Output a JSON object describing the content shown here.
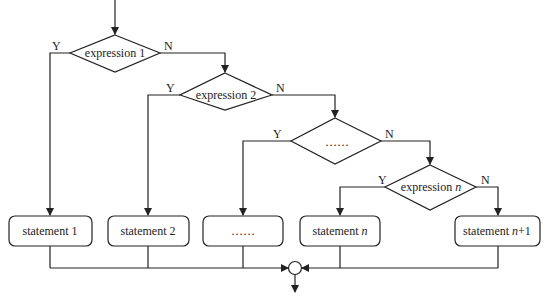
{
  "diagram": {
    "type": "flowchart",
    "decisions": [
      {
        "id": "d1",
        "label": "expression 1",
        "italic_part": "",
        "yes": "Y",
        "no": "N"
      },
      {
        "id": "d2",
        "label": "expression 2",
        "italic_part": "",
        "yes": "Y",
        "no": "N"
      },
      {
        "id": "d3",
        "label": "……",
        "italic_part": "",
        "yes": "Y",
        "no": "N"
      },
      {
        "id": "d4",
        "label": "expression ",
        "italic_part": "n",
        "yes": "Y",
        "no": "N"
      }
    ],
    "statements": [
      {
        "id": "s1",
        "label": "statement 1",
        "italic_part": "",
        "suffix": ""
      },
      {
        "id": "s2",
        "label": "statement 2",
        "italic_part": "",
        "suffix": ""
      },
      {
        "id": "s3",
        "label": "……",
        "italic_part": "",
        "suffix": ""
      },
      {
        "id": "s4",
        "label": "statement ",
        "italic_part": "n",
        "suffix": ""
      },
      {
        "id": "s5",
        "label": "statement ",
        "italic_part": "n",
        "suffix": "+1"
      }
    ],
    "edges": [
      {
        "from": "start",
        "to": "d1"
      },
      {
        "from": "d1",
        "to": "s1",
        "label": "Y"
      },
      {
        "from": "d1",
        "to": "d2",
        "label": "N"
      },
      {
        "from": "d2",
        "to": "s2",
        "label": "Y"
      },
      {
        "from": "d2",
        "to": "d3",
        "label": "N"
      },
      {
        "from": "d3",
        "to": "s3",
        "label": "Y"
      },
      {
        "from": "d3",
        "to": "d4",
        "label": "N"
      },
      {
        "from": "d4",
        "to": "s4",
        "label": "Y"
      },
      {
        "from": "d4",
        "to": "s5",
        "label": "N"
      },
      {
        "from": "s1",
        "to": "join"
      },
      {
        "from": "s2",
        "to": "join"
      },
      {
        "from": "s3",
        "to": "join"
      },
      {
        "from": "s4",
        "to": "join"
      },
      {
        "from": "s5",
        "to": "join"
      },
      {
        "from": "join",
        "to": "end"
      }
    ],
    "colors": {
      "stroke": "#222222",
      "background": "#ffffff"
    }
  }
}
